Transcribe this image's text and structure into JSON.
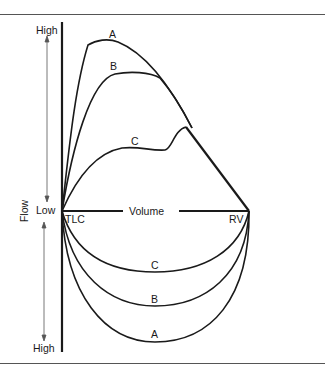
{
  "diagram": {
    "type": "flow-volume loops",
    "y_axis": {
      "label": "Flow",
      "top_label": "High",
      "middle_label": "Low",
      "bottom_label": "High"
    },
    "x_axis": {
      "label": "Volume",
      "left_label": "TLC",
      "right_label": "RV"
    },
    "curves": {
      "expiratory": [
        {
          "label": "A"
        },
        {
          "label": "B"
        },
        {
          "label": "C"
        }
      ],
      "inspiratory": [
        {
          "label": "C"
        },
        {
          "label": "B"
        },
        {
          "label": "A"
        }
      ]
    },
    "colors": {
      "line": "#1a1a1a",
      "arrow": "#555555",
      "rule": "#555555"
    }
  }
}
